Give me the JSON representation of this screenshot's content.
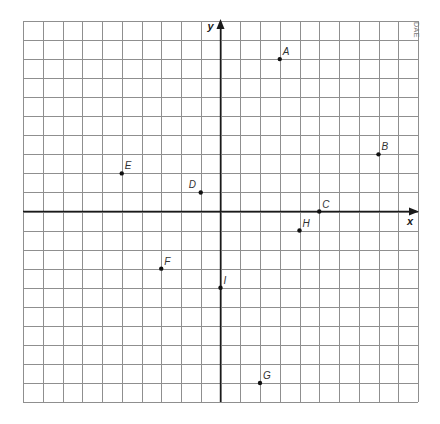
{
  "figure": {
    "credit_text": "DAE",
    "axis_labels": {
      "x": "x",
      "y": "y"
    },
    "grid": {
      "x_min": -10,
      "x_max": 10,
      "y_min": -10,
      "y_max": 10,
      "step": 1,
      "line_color": "#8f8f8f",
      "axis_color": "#1a1a1a"
    },
    "points": [
      {
        "label": "A",
        "x": 3,
        "y": 8
      },
      {
        "label": "B",
        "x": 8,
        "y": 3
      },
      {
        "label": "C",
        "x": 5,
        "y": 0
      },
      {
        "label": "D",
        "x": -1,
        "y": 1
      },
      {
        "label": "E",
        "x": -5,
        "y": 2
      },
      {
        "label": "F",
        "x": -3,
        "y": -3
      },
      {
        "label": "G",
        "x": 2,
        "y": -9
      },
      {
        "label": "H",
        "x": 4,
        "y": -1
      },
      {
        "label": "I",
        "x": 0,
        "y": -4
      }
    ]
  },
  "chart_data": {
    "type": "scatter",
    "title": "",
    "xlabel": "x",
    "ylabel": "y",
    "xlim": [
      -10,
      10
    ],
    "ylim": [
      -10,
      10
    ],
    "grid": true,
    "tick_labels": false,
    "points": [
      {
        "label": "A",
        "x": 3,
        "y": 8
      },
      {
        "label": "B",
        "x": 8,
        "y": 3
      },
      {
        "label": "C",
        "x": 5,
        "y": 0
      },
      {
        "label": "D",
        "x": -1,
        "y": 1
      },
      {
        "label": "E",
        "x": -5,
        "y": 2
      },
      {
        "label": "F",
        "x": -3,
        "y": -3
      },
      {
        "label": "G",
        "x": 2,
        "y": -9
      },
      {
        "label": "H",
        "x": 4,
        "y": -1
      },
      {
        "label": "I",
        "x": 0,
        "y": -4
      }
    ]
  }
}
